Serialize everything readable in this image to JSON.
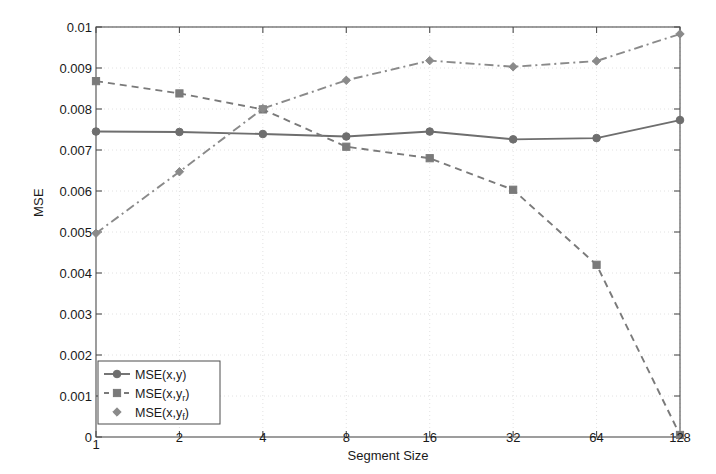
{
  "chart_data": {
    "type": "line",
    "title": "",
    "xlabel": "Segment Size",
    "ylabel": "MSE",
    "categories": [
      "1",
      "2",
      "4",
      "8",
      "16",
      "32",
      "64",
      "128"
    ],
    "x": [
      1,
      2,
      4,
      8,
      16,
      32,
      64,
      128
    ],
    "xscale": "log2",
    "xtick_labels": [
      "1",
      "2",
      "4",
      "8",
      "16",
      "32",
      "64",
      "128"
    ],
    "ytick_labels": [
      "0",
      "0.001",
      "0.002",
      "0.003",
      "0.004",
      "0.005",
      "0.006",
      "0.007",
      "0.008",
      "0.009",
      "0.01"
    ],
    "ytick_values": [
      0,
      0.001,
      0.002,
      0.003,
      0.004,
      0.005,
      0.006,
      0.007,
      0.008,
      0.009,
      0.01
    ],
    "ylim": [
      0,
      0.01
    ],
    "grid": true,
    "legend_position": "lower-left",
    "series": [
      {
        "name": "MSE(x,y)",
        "label_base": "MSE(x,y)",
        "label_subscript": "",
        "linestyle": "solid",
        "marker": "circle",
        "color": "#6e6e6e",
        "values": [
          0.00745,
          0.00744,
          0.00739,
          0.00733,
          0.00745,
          0.00726,
          0.00729,
          0.00773
        ]
      },
      {
        "name": "MSE(x,yr)",
        "label_base": "MSE(x,y",
        "label_subscript": "r",
        "label_tail": ")",
        "linestyle": "dashed",
        "marker": "square",
        "color": "#7a7a7a",
        "values": [
          0.00868,
          0.00838,
          0.00799,
          0.00708,
          0.0068,
          0.00603,
          0.0042,
          5e-05
        ]
      },
      {
        "name": "MSE(x,yf)",
        "label_base": "MSE(x,y",
        "label_subscript": "f",
        "label_tail": ")",
        "linestyle": "dashdot",
        "marker": "diamond",
        "color": "#8a8a8a",
        "values": [
          0.00497,
          0.00647,
          0.00801,
          0.0087,
          0.00918,
          0.00903,
          0.00917,
          0.00983
        ]
      }
    ],
    "legend": [
      {
        "text": "MSE(x,y)",
        "base": "MSE(x,y)",
        "sub": "",
        "tail": "",
        "marker": "circle",
        "linestyle": "solid"
      },
      {
        "text": "MSE(x,yr)",
        "base": "MSE(x,y",
        "sub": "r",
        "tail": ")",
        "marker": "square",
        "linestyle": "dashed"
      },
      {
        "text": "MSE(x,yf)",
        "base": "MSE(x,y",
        "sub": "f",
        "tail": ")",
        "marker": "diamond",
        "linestyle": "dashdot"
      }
    ],
    "colors": {
      "axis": "#4d4d4d",
      "grid": "#e2e2e2",
      "text": "#1a1a1a",
      "background": "#ffffff"
    }
  }
}
